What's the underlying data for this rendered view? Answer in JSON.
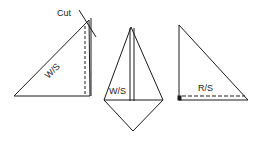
{
  "diagram": {
    "figures": [
      {
        "id": "figure-1",
        "label": "W/S",
        "annotation": "Cut"
      },
      {
        "id": "figure-2",
        "label": "W/S"
      },
      {
        "id": "figure-3",
        "label": "R/S"
      }
    ],
    "colors": {
      "stroke": "#1a1a1a",
      "background": "#ffffff"
    }
  }
}
